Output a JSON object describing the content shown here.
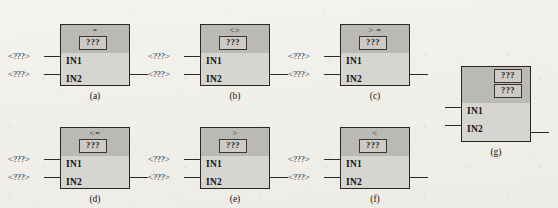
{
  "figure": {
    "background_color": "#f2f0ec",
    "block_fill": "#d7d5d1",
    "header_fill": "#bbb9b4",
    "border_color": "#2a2724",
    "placeholder_box": "???",
    "input_label": "<???>",
    "pin1": "IN1",
    "pin2": "IN2"
  },
  "blocks": [
    {
      "id": "a",
      "caption": "(a)",
      "operator": "=",
      "operator_style": "equals-mark",
      "pin1": "IN1",
      "pin2": "IN2",
      "in1_label": "<???>",
      "in2_label": "<???>",
      "qbox1": "???",
      "qbox2": null,
      "has_input_labels": true
    },
    {
      "id": "b",
      "caption": "(b)",
      "operator": "<>",
      "operator_style": "normal",
      "pin1": "IN1",
      "pin2": "IN2",
      "in1_label": "<???>",
      "in2_label": "<???>",
      "qbox1": "???",
      "qbox2": null,
      "has_input_labels": true
    },
    {
      "id": "c",
      "caption": "(c)",
      "operator": "> =",
      "operator_style": "normal",
      "pin1": "IN1",
      "pin2": "IN2",
      "in1_label": "<???>",
      "in2_label": "<???>",
      "qbox1": "???",
      "qbox2": null,
      "has_input_labels": true
    },
    {
      "id": "d",
      "caption": "(d)",
      "operator": "<=",
      "operator_style": "normal",
      "pin1": "IN1",
      "pin2": "IN2",
      "in1_label": "<???>",
      "in2_label": "<???>",
      "qbox1": "???",
      "qbox2": null,
      "has_input_labels": true
    },
    {
      "id": "e",
      "caption": "(e)",
      "operator": ">",
      "operator_style": "normal",
      "pin1": "IN1",
      "pin2": "IN2",
      "in1_label": "<???>",
      "in2_label": "<???>",
      "qbox1": "???",
      "qbox2": null,
      "has_input_labels": true
    },
    {
      "id": "f",
      "caption": "(f)",
      "operator": "<",
      "operator_style": "normal",
      "pin1": "IN1",
      "pin2": "IN2",
      "in1_label": "<???>",
      "in2_label": "<???>",
      "qbox1": "???",
      "qbox2": null,
      "has_input_labels": true
    },
    {
      "id": "g",
      "caption": "(g)",
      "operator": "",
      "operator_style": "normal",
      "pin1": "IN1",
      "pin2": "IN2",
      "in1_label": "",
      "in2_label": "",
      "qbox1": "???",
      "qbox2": "???",
      "has_input_labels": false
    }
  ]
}
